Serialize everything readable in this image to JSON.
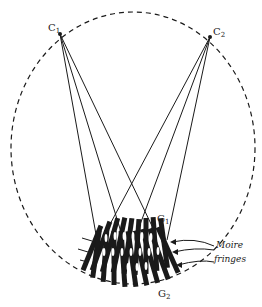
{
  "figure": {
    "colors": {
      "ink": "#1a1a1a",
      "background": "#ffffff"
    },
    "circle": {
      "cx": 133,
      "cy": 148,
      "rx": 122,
      "ry": 136,
      "style": "dashed"
    },
    "sources": [
      {
        "id": "C1",
        "label_main": "C",
        "label_sub": "1",
        "x": 60,
        "y": 34
      },
      {
        "id": "C2",
        "label_main": "C",
        "label_sub": "2",
        "x": 210,
        "y": 37
      }
    ],
    "rays": [
      {
        "from": "C1",
        "to": [
          96,
          240
        ]
      },
      {
        "from": "C1",
        "to": [
          120,
          232
        ]
      },
      {
        "from": "C1",
        "to": [
          152,
          226
        ]
      },
      {
        "from": "C2",
        "to": [
          108,
          226
        ]
      },
      {
        "from": "C2",
        "to": [
          138,
          228
        ]
      },
      {
        "from": "C2",
        "to": [
          166,
          240
        ]
      }
    ],
    "gratings": [
      {
        "id": "G1",
        "label_main": "G",
        "label_sub": "1"
      },
      {
        "id": "G2",
        "label_main": "G",
        "label_sub": "2"
      }
    ],
    "annotation": {
      "line1": "Moire",
      "line2": "fringes"
    }
  }
}
